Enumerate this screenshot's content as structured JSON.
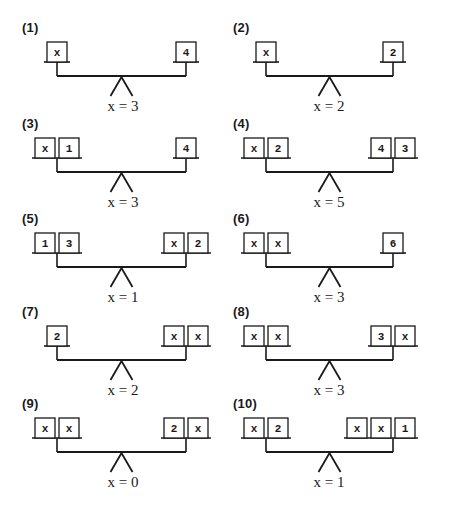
{
  "colors": {
    "ink": "#1a1a1a",
    "background": "#ffffff",
    "box_fill": "#ffffff"
  },
  "icons": {
    "balance-scale": "two-pan balance beam on triangular fulcrum"
  },
  "problems": [
    {
      "label": "(1)",
      "left": [
        "x"
      ],
      "right": [
        "4"
      ],
      "solution": "x = 3"
    },
    {
      "label": "(2)",
      "left": [
        "x"
      ],
      "right": [
        "2"
      ],
      "solution": "x = 2"
    },
    {
      "label": "(3)",
      "left": [
        "x",
        "1"
      ],
      "right": [
        "4"
      ],
      "solution": "x = 3"
    },
    {
      "label": "(4)",
      "left": [
        "x",
        "2"
      ],
      "right": [
        "4",
        "3"
      ],
      "solution": "x = 5"
    },
    {
      "label": "(5)",
      "left": [
        "1",
        "3"
      ],
      "right": [
        "x",
        "2"
      ],
      "solution": "x = 1"
    },
    {
      "label": "(6)",
      "left": [
        "x",
        "x"
      ],
      "right": [
        "6"
      ],
      "solution": "x = 3"
    },
    {
      "label": "(7)",
      "left": [
        "2"
      ],
      "right": [
        "x",
        "x"
      ],
      "solution": "x = 2"
    },
    {
      "label": "(8)",
      "left": [
        "x",
        "x"
      ],
      "right": [
        "3",
        "x"
      ],
      "solution": "x = 3"
    },
    {
      "label": "(9)",
      "left": [
        "x",
        "x"
      ],
      "right": [
        "2",
        "x"
      ],
      "solution": "x = 0"
    },
    {
      "label": "(10)",
      "left": [
        "x",
        "2"
      ],
      "right": [
        "x",
        "x",
        "1"
      ],
      "solution": "x = 1"
    }
  ]
}
